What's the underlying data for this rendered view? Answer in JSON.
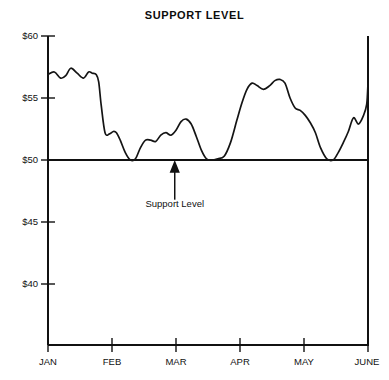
{
  "chart_data": {
    "type": "line",
    "title": "SUPPORT LEVEL",
    "xlabel": "",
    "ylabel": "",
    "ylim": [
      37.5,
      60
    ],
    "xlim": [
      0,
      5.05
    ],
    "grid": false,
    "legend": "none",
    "y_ticks": [
      {
        "value": 60,
        "label": "$60"
      },
      {
        "value": 55,
        "label": "$55"
      },
      {
        "value": 50,
        "label": "$50"
      },
      {
        "value": 45,
        "label": "$45"
      },
      {
        "value": 40,
        "label": "$40"
      }
    ],
    "x_ticks": [
      {
        "value": 0,
        "label": "JAN"
      },
      {
        "value": 1,
        "label": "FEB"
      },
      {
        "value": 2,
        "label": "MAR"
      },
      {
        "value": 3,
        "label": "APR"
      },
      {
        "value": 4,
        "label": "MAY"
      },
      {
        "value": 5,
        "label": "JUNE"
      }
    ],
    "annotations": [
      {
        "text": "Support Level",
        "x": 2.0,
        "y": 50,
        "arrow": "up",
        "arrow_from_y": 46.8
      }
    ],
    "reference_lines": [
      {
        "name": "support",
        "y": 50,
        "label": "Support Level"
      }
    ],
    "series": [
      {
        "name": "Price",
        "points_x": [
          0.0,
          0.1,
          0.2,
          0.28,
          0.36,
          0.46,
          0.56,
          0.64,
          0.7,
          0.76,
          0.8,
          0.84,
          0.9,
          0.97,
          1.03,
          1.08,
          1.14,
          1.22,
          1.3,
          1.38,
          1.46,
          1.54,
          1.62,
          1.7,
          1.78,
          1.86,
          1.94,
          2.02,
          2.1,
          2.18,
          2.26,
          2.34,
          2.42,
          2.5,
          2.58,
          2.68,
          2.78,
          2.88,
          2.98,
          3.06,
          3.14,
          3.22,
          3.3,
          3.4,
          3.5,
          3.58,
          3.66,
          3.74,
          3.82,
          3.9,
          3.98,
          4.06,
          4.14,
          4.22,
          4.3,
          4.4,
          4.5,
          4.58,
          4.66,
          4.74,
          4.82,
          4.9,
          4.98,
          5.03
        ],
        "points_y": [
          56.9,
          57.1,
          56.6,
          56.8,
          57.4,
          57.0,
          56.6,
          57.1,
          57.0,
          56.9,
          56.3,
          54.4,
          52.2,
          52.1,
          52.3,
          52.2,
          51.6,
          50.6,
          50.0,
          50.1,
          51.0,
          51.6,
          51.6,
          51.5,
          52.0,
          52.2,
          52.0,
          52.4,
          53.1,
          53.3,
          52.9,
          51.9,
          50.8,
          50.1,
          50.0,
          50.1,
          50.3,
          51.4,
          53.2,
          54.6,
          55.7,
          56.2,
          56.0,
          55.7,
          56.0,
          56.4,
          56.5,
          56.2,
          55.0,
          54.2,
          54.0,
          53.6,
          53.0,
          52.2,
          51.0,
          50.1,
          50.0,
          50.6,
          51.4,
          52.3,
          53.4,
          52.9,
          53.6,
          54.5
        ],
        "final_x": 5.05,
        "final_y": 56.2,
        "key_values": {
          "start": 56.9,
          "jan_high": 57.4,
          "first_support_touch": 50.0,
          "feb_rebound_high": 53.3,
          "second_support_touch": 50.0,
          "april_high": 56.5,
          "third_support_touch": 50.0,
          "june_end": 56.2
        }
      }
    ]
  },
  "axis_labels": {
    "y": [
      "$60",
      "$55",
      "$50",
      "$45",
      "$40"
    ],
    "x": [
      "JAN",
      "FEB",
      "MAR",
      "APR",
      "MAY",
      "JUNE"
    ]
  },
  "annotation": {
    "support_label": "Support Level"
  },
  "colors": {
    "ink": "#111111",
    "curve": "#141414",
    "background": "#ffffff"
  }
}
